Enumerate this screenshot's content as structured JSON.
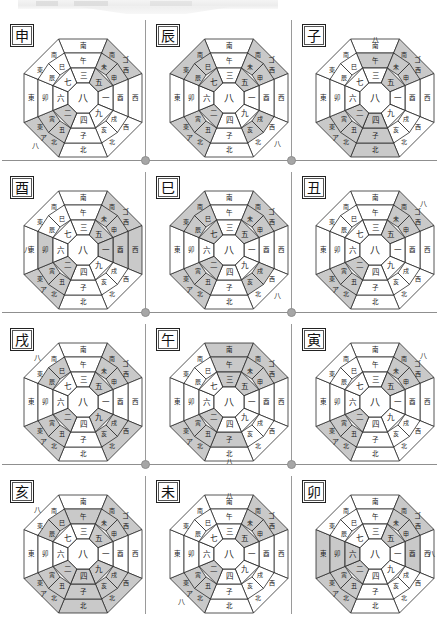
{
  "page": {
    "columns": 3,
    "rows": 4,
    "background": "#ffffff",
    "shade_color": "#c9c9c9",
    "line_color": "#2b2b2b",
    "divider_color": "#9a9a9a",
    "dot_color": "#a6a6a6"
  },
  "legend": {
    "center_number": "八",
    "ring_numbers_clockwise_from_top": [
      "三",
      "五",
      "一",
      "九",
      "四",
      "二",
      "六",
      "七"
    ],
    "outer_directions": [
      "南",
      "西",
      "北",
      "東"
    ],
    "branch_ring_clockwise_from_top": [
      "午",
      "未",
      "申",
      "酉",
      "戌",
      "亥",
      "子",
      "丑",
      "寅",
      "卯",
      "辰",
      "巳"
    ],
    "corner_marks": [
      "ゴ",
      "ア",
      "八"
    ]
  },
  "cells": [
    {
      "id": "cell-shen",
      "branch": "申",
      "row": 0,
      "col": 0,
      "center": "八",
      "ring": [
        "三",
        "五",
        "一",
        "九",
        "四",
        "二",
        "六",
        "七"
      ],
      "shaded_sectors": [
        "NE",
        "SW"
      ],
      "shaded_branches": [
        "未",
        "申",
        "丑",
        "寅"
      ],
      "corner_labels": [
        {
          "text": "ゴ",
          "pos": "NE"
        },
        {
          "text": "ア",
          "pos": "SW"
        },
        {
          "text": "八",
          "pos": "SW-outer"
        }
      ]
    },
    {
      "id": "cell-chen",
      "branch": "辰",
      "row": 0,
      "col": 1,
      "center": "八",
      "ring": [
        "三",
        "五",
        "一",
        "九",
        "四",
        "二",
        "六",
        "七"
      ],
      "shaded_sectors": [
        "NE",
        "SE",
        "SW"
      ],
      "shaded_branches": [
        "未",
        "申",
        "戌",
        "亥",
        "丑",
        "寅"
      ],
      "corner_labels": [
        {
          "text": "ゴ",
          "pos": "NE"
        },
        {
          "text": "ア",
          "pos": "SW"
        },
        {
          "text": "八",
          "pos": "SE-outer"
        }
      ]
    },
    {
      "id": "cell-zi",
      "branch": "子",
      "row": 0,
      "col": 2,
      "center": "八",
      "ring": [
        "三",
        "五",
        "一",
        "九",
        "四",
        "二",
        "六",
        "七"
      ],
      "shaded_sectors": [
        "N",
        "NE",
        "SW"
      ],
      "shaded_branches": [
        "午",
        "未",
        "申",
        "丑",
        "寅"
      ],
      "corner_labels": [
        {
          "text": "ゴ",
          "pos": "NE"
        },
        {
          "text": "ア",
          "pos": "SW"
        },
        {
          "text": "八",
          "pos": "N-outer"
        }
      ]
    },
    {
      "id": "cell-you",
      "branch": "酉",
      "row": 1,
      "col": 0,
      "center": "八",
      "ring": [
        "三",
        "五",
        "一",
        "九",
        "四",
        "二",
        "六",
        "七"
      ],
      "shaded_sectors": [
        "NE",
        "W",
        "SW"
      ],
      "shaded_branches": [
        "未",
        "申",
        "卯",
        "丑",
        "寅"
      ],
      "corner_labels": [
        {
          "text": "ゴ",
          "pos": "NE"
        },
        {
          "text": "ア",
          "pos": "SW"
        },
        {
          "text": "八",
          "pos": "W-outer"
        }
      ]
    },
    {
      "id": "cell-si",
      "branch": "巳",
      "row": 1,
      "col": 1,
      "center": "八",
      "ring": [
        "三",
        "五",
        "一",
        "九",
        "四",
        "二",
        "六",
        "七"
      ],
      "shaded_sectors": [
        "NE",
        "SE",
        "SW"
      ],
      "shaded_branches": [
        "未",
        "申",
        "戌",
        "亥",
        "丑",
        "寅"
      ],
      "corner_labels": [
        {
          "text": "ゴ",
          "pos": "NE"
        },
        {
          "text": "ア",
          "pos": "SW"
        },
        {
          "text": "八",
          "pos": "SE-outer"
        }
      ]
    },
    {
      "id": "cell-chou",
      "branch": "丑",
      "row": 1,
      "col": 2,
      "center": "八",
      "ring": [
        "三",
        "五",
        "一",
        "九",
        "四",
        "二",
        "六",
        "七"
      ],
      "shaded_sectors": [
        "NE",
        "SW"
      ],
      "shaded_branches": [
        "未",
        "申",
        "丑",
        "寅"
      ],
      "corner_labels": [
        {
          "text": "ゴ",
          "pos": "NE"
        },
        {
          "text": "ア",
          "pos": "SW"
        },
        {
          "text": "八",
          "pos": "NE-outer"
        }
      ]
    },
    {
      "id": "cell-xu",
      "branch": "戌",
      "row": 2,
      "col": 0,
      "center": "八",
      "ring": [
        "三",
        "五",
        "一",
        "九",
        "四",
        "二",
        "六",
        "七"
      ],
      "shaded_sectors": [
        "NW",
        "NE",
        "SW"
      ],
      "shaded_branches": [
        "巳",
        "辰",
        "未",
        "申",
        "丑",
        "寅"
      ],
      "corner_labels": [
        {
          "text": "ゴ",
          "pos": "NE"
        },
        {
          "text": "ア",
          "pos": "SW"
        },
        {
          "text": "八",
          "pos": "NW-outer"
        }
      ]
    },
    {
      "id": "cell-wu",
      "branch": "午",
      "row": 2,
      "col": 1,
      "center": "八",
      "ring": [
        "三",
        "五",
        "一",
        "九",
        "四",
        "二",
        "六",
        "七"
      ],
      "shaded_sectors": [
        "NE",
        "SW",
        "S"
      ],
      "shaded_branches": [
        "未",
        "申",
        "丑",
        "寅",
        "子"
      ],
      "corner_labels": [
        {
          "text": "ゴ",
          "pos": "NE"
        },
        {
          "text": "ア",
          "pos": "SW"
        },
        {
          "text": "八",
          "pos": "S-outer"
        }
      ]
    },
    {
      "id": "cell-yin",
      "branch": "寅",
      "row": 2,
      "col": 2,
      "center": "八",
      "ring": [
        "三",
        "五",
        "一",
        "九",
        "四",
        "二",
        "六",
        "七"
      ],
      "shaded_sectors": [
        "NE",
        "SW"
      ],
      "shaded_branches": [
        "未",
        "申",
        "丑",
        "寅"
      ],
      "corner_labels": [
        {
          "text": "ゴ",
          "pos": "NE"
        },
        {
          "text": "ア",
          "pos": "SW"
        },
        {
          "text": "八",
          "pos": "NE-outer"
        }
      ]
    },
    {
      "id": "cell-hai",
      "branch": "亥",
      "row": 3,
      "col": 0,
      "center": "八",
      "ring": [
        "三",
        "五",
        "一",
        "九",
        "四",
        "二",
        "六",
        "七"
      ],
      "shaded_sectors": [
        "NW",
        "N",
        "NE",
        "SW"
      ],
      "shaded_branches": [
        "巳",
        "辰",
        "午",
        "未",
        "申",
        "丑",
        "寅"
      ],
      "corner_labels": [
        {
          "text": "ゴ",
          "pos": "NE"
        },
        {
          "text": "ア",
          "pos": "SW"
        },
        {
          "text": "八",
          "pos": "NW-outer"
        }
      ]
    },
    {
      "id": "cell-wei",
      "branch": "未",
      "row": 3,
      "col": 1,
      "center": "八",
      "ring": [
        "三",
        "五",
        "一",
        "九",
        "四",
        "二",
        "六",
        "七"
      ],
      "shaded_sectors": [
        "NE",
        "SW"
      ],
      "shaded_branches": [
        "未",
        "申",
        "丑",
        "寅"
      ],
      "corner_labels": [
        {
          "text": "ゴ",
          "pos": "NE"
        },
        {
          "text": "ア",
          "pos": "SW"
        },
        {
          "text": "八",
          "pos": "N-outer"
        },
        {
          "text": "八",
          "pos": "SW-outer"
        }
      ]
    },
    {
      "id": "cell-mao",
      "branch": "卯",
      "row": 3,
      "col": 2,
      "center": "八",
      "ring": [
        "三",
        "五",
        "一",
        "九",
        "四",
        "二",
        "六",
        "七"
      ],
      "shaded_sectors": [
        "NE",
        "E",
        "SW"
      ],
      "shaded_branches": [
        "未",
        "申",
        "酉",
        "丑",
        "寅"
      ],
      "corner_labels": [
        {
          "text": "ゴ",
          "pos": "NE"
        },
        {
          "text": "ア",
          "pos": "SW"
        },
        {
          "text": "八",
          "pos": "E-outer"
        }
      ]
    }
  ],
  "labels": {
    "dir_s": "南",
    "dir_w": "西",
    "dir_n": "北",
    "dir_e": "東",
    "b_wu": "午",
    "b_wei": "未",
    "b_shen": "申",
    "b_you": "酉",
    "b_xu": "戌",
    "b_hai": "亥",
    "b_zi": "子",
    "b_chou": "丑",
    "b_yin": "寅",
    "b_mao": "卯",
    "b_chen": "辰",
    "b_si": "巳",
    "n1": "一",
    "n2": "二",
    "n3": "三",
    "n4": "四",
    "n5": "五",
    "n6": "六",
    "n7": "七",
    "n8": "八",
    "n9": "九",
    "k_go": "ゴ",
    "k_a": "ア"
  }
}
